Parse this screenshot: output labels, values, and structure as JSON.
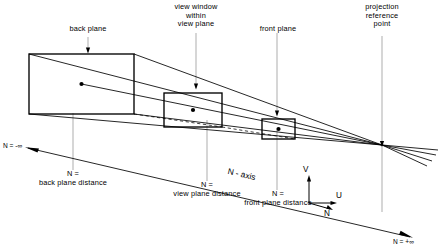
{
  "callouts": {
    "back_plane": "back plane",
    "view_window": "view window\nwithin\nview plane",
    "front_plane": "front plane",
    "projection_reference_point": "projection\nreference\npoint"
  },
  "axis": {
    "name": "N - axis",
    "neg_infinity": "N = -∞",
    "pos_infinity": "N = +∞",
    "back_plane_distance": "N =\nback plane distance",
    "view_plane_distance": "N =\nview plane distance",
    "front_plane_distance": "N =\nfront plane distance"
  },
  "triad": {
    "v_label": "V",
    "u_label": "U",
    "n_label": "N"
  },
  "colors": {
    "stroke": "#000000",
    "leader": "#8a8a8a",
    "background": "#ffffff"
  }
}
